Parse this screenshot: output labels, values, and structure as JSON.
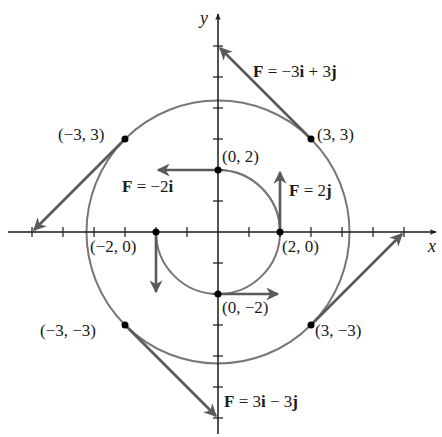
{
  "diagram": {
    "axes": {
      "x_label": "x",
      "y_label": "y",
      "x_ticks": [
        -6,
        -5,
        -4,
        -3,
        -2,
        -1,
        1,
        2,
        3,
        4,
        5,
        6
      ],
      "y_ticks": [
        -6,
        -5,
        -4,
        -3,
        -2,
        -1,
        1,
        2,
        3,
        4,
        5,
        6
      ]
    },
    "circles": [
      {
        "name": "inner",
        "radius": 2
      },
      {
        "name": "outer",
        "radius": 4.2426
      }
    ],
    "points": [
      {
        "label": "(0, 2)",
        "x": 0,
        "y": 2
      },
      {
        "label": "(2, 0)",
        "x": 2,
        "y": 0
      },
      {
        "label": "(−2, 0)",
        "x": -2,
        "y": 0
      },
      {
        "label": "(0, −2)",
        "x": 0,
        "y": -2
      },
      {
        "label": "(3, 3)",
        "x": 3,
        "y": 3
      },
      {
        "label": "(−3, 3)",
        "x": -3,
        "y": 3
      },
      {
        "label": "(−3, −3)",
        "x": -3,
        "y": -3
      },
      {
        "label": "(3, −3)",
        "x": 3,
        "y": -3
      }
    ],
    "vectors": [
      {
        "from": [
          0,
          2
        ],
        "vec": [
          -2,
          0
        ],
        "label_prefix": "F",
        "label_eq": " = −2",
        "label_unit": "i",
        "label_full": "F = −2i"
      },
      {
        "from": [
          2,
          0
        ],
        "vec": [
          0,
          2
        ],
        "label_prefix": "F",
        "label_eq": " = 2",
        "label_unit": "j",
        "label_full": "F = 2j"
      },
      {
        "from": [
          -2,
          0
        ],
        "vec": [
          0,
          -2
        ]
      },
      {
        "from": [
          0,
          -2
        ],
        "vec": [
          2,
          0
        ]
      },
      {
        "from": [
          3,
          3
        ],
        "vec": [
          -3,
          3
        ],
        "label_full": "F = −3i + 3j"
      },
      {
        "from": [
          -3,
          3
        ],
        "vec": [
          -3,
          -3
        ]
      },
      {
        "from": [
          -3,
          -3
        ],
        "vec": [
          3,
          -3
        ],
        "label_full": "F = 3i − 3j"
      },
      {
        "from": [
          3,
          -3
        ],
        "vec": [
          3,
          3
        ]
      }
    ],
    "labels": {
      "p_0_2": "(0, 2)",
      "p_2_0": "(2, 0)",
      "p_m2_0": "(−2, 0)",
      "p_0_m2": "(0, −2)",
      "p_3_3": "(3, 3)",
      "p_m3_3": "(−3, 3)",
      "p_m3_m3": "(−3, −3)",
      "p_3_m3": "(3, −3)",
      "f_top": {
        "F": "F",
        "eq": " = −3",
        "i": "i",
        "plus": " + 3",
        "j": "j"
      },
      "f_left": {
        "F": "F",
        "eq": " = −2",
        "i": "i"
      },
      "f_right": {
        "F": "F",
        "eq": " = 2",
        "j": "j"
      },
      "f_bottom": {
        "F": "F",
        "eq": " = 3",
        "i": "i",
        "minus": " − 3",
        "j": "j"
      }
    },
    "colors": {
      "axis": "#1a1a1a",
      "circle": "#6e6e6e",
      "vector": "#5a5a5a",
      "point": "#000000"
    }
  }
}
